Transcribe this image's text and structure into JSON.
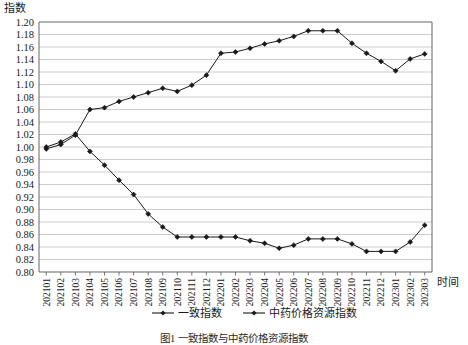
{
  "axis": {
    "y_title": "指数",
    "x_title": "时间",
    "y_ticks": [
      "0.80",
      "0.82",
      "0.84",
      "0.86",
      "0.88",
      "0.90",
      "0.92",
      "0.94",
      "0.96",
      "0.98",
      "1.00",
      "1.02",
      "1.04",
      "1.06",
      "1.08",
      "1.10",
      "1.12",
      "1.14",
      "1.16",
      "1.18",
      "1.20"
    ],
    "x_ticks": [
      "202101",
      "202102",
      "202103",
      "202104",
      "202105",
      "202106",
      "202107",
      "202108",
      "202109",
      "202110",
      "202111",
      "202112",
      "202201",
      "202202",
      "202203",
      "202204",
      "202205",
      "202206",
      "202207",
      "202208",
      "202209",
      "202210",
      "202211",
      "202212",
      "202301",
      "202302",
      "202303"
    ]
  },
  "legend": {
    "items": [
      {
        "label": "一致指数",
        "color": "#1a1a1a"
      },
      {
        "label": "中药价格资源指数",
        "color": "#1a1a1a"
      }
    ]
  },
  "caption": "图1 一致指数与中药价格资源指数",
  "chart_data": {
    "type": "line",
    "title": "",
    "xlabel": "时间",
    "ylabel": "指数",
    "ylim": [
      0.8,
      1.2
    ],
    "ytick_step": 0.02,
    "grid": true,
    "legend_position": "bottom",
    "marker": "diamond",
    "line_color": "#1a1a1a",
    "categories": [
      "202101",
      "202102",
      "202103",
      "202104",
      "202105",
      "202106",
      "202107",
      "202108",
      "202109",
      "202110",
      "202111",
      "202112",
      "202201",
      "202202",
      "202203",
      "202204",
      "202205",
      "202206",
      "202207",
      "202208",
      "202209",
      "202210",
      "202211",
      "202212",
      "202301",
      "202302",
      "202303"
    ],
    "series": [
      {
        "name": "一致指数",
        "values": [
          1.0,
          1.008,
          1.021,
          0.993,
          0.971,
          0.947,
          0.924,
          0.893,
          0.872,
          0.856,
          0.856,
          0.856,
          0.856,
          0.856,
          0.85,
          0.846,
          0.838,
          0.843,
          0.853,
          0.853,
          0.853,
          0.845,
          0.833,
          0.833,
          0.833,
          0.848,
          0.875
        ]
      },
      {
        "name": "中药价格资源指数",
        "values": [
          0.997,
          1.004,
          1.019,
          1.06,
          1.063,
          1.073,
          1.08,
          1.087,
          1.094,
          1.089,
          1.099,
          1.115,
          1.15,
          1.152,
          1.158,
          1.165,
          1.17,
          1.177,
          1.186,
          1.186,
          1.186,
          1.166,
          1.15,
          1.137,
          1.122,
          1.141,
          1.149
        ]
      }
    ]
  },
  "geometry": {
    "plot_left": 39,
    "plot_right": 432,
    "plot_top": 22,
    "plot_bottom": 272
  }
}
